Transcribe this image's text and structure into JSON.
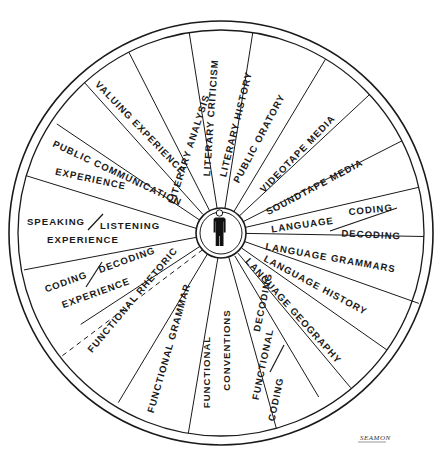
{
  "diagram": {
    "type": "wheel",
    "center_figure": "standing-person-silhouette",
    "colors": {
      "ink": "#1a1a1a",
      "background": "#ffffff"
    },
    "signature": "SEAMON",
    "segments": [
      {
        "id": "literary-criticism",
        "lines": [
          "LITERARY  CRITICISM"
        ]
      },
      {
        "id": "literary-history",
        "lines": [
          "LITERARY  HISTORY"
        ]
      },
      {
        "id": "public-oratory",
        "lines": [
          "PUBLIC  ORATORY"
        ]
      },
      {
        "id": "videotape-media",
        "lines": [
          "VIDEOTAPE  MEDIA"
        ]
      },
      {
        "id": "soundtape-media",
        "lines": [
          "SOUNDTAPE  MEDIA"
        ]
      },
      {
        "id": "language-coding-decoding",
        "lines": [
          "LANGUAGE",
          "CODING",
          "DECODING"
        ]
      },
      {
        "id": "language-grammars",
        "lines": [
          "LANGUAGE  GRAMMARS"
        ]
      },
      {
        "id": "language-history",
        "lines": [
          "LANGUAGE  HISTORY"
        ]
      },
      {
        "id": "language-geography",
        "lines": [
          "LANGUAGE  GEOGRAPHY"
        ]
      },
      {
        "id": "functional-coding-decoding",
        "lines": [
          "FUNCTIONAL",
          "CODING",
          "DECODING"
        ]
      },
      {
        "id": "functional-conventions",
        "lines": [
          "FUNCTIONAL",
          "CONVENTIONS"
        ]
      },
      {
        "id": "functional-grammar",
        "lines": [
          "FUNCTIONAL  GRAMMAR"
        ]
      },
      {
        "id": "functional-rhetoric",
        "lines": [
          "FUNCTIONAL  RHETORIC"
        ]
      },
      {
        "id": "coding-decoding-experience",
        "lines": [
          "CODING",
          "DECODING",
          "EXPERIENCE"
        ]
      },
      {
        "id": "speaking-listening-experience",
        "lines": [
          "SPEAKING",
          "LISTENING",
          "EXPERIENCE"
        ]
      },
      {
        "id": "public-communication-experience",
        "lines": [
          "PUBLIC  COMMUNICATION",
          "EXPERIENCE"
        ]
      },
      {
        "id": "valuing-experience",
        "lines": [
          "VALUING  EXPERIENCE"
        ]
      },
      {
        "id": "literary-analysis",
        "lines": [
          "LITERARY  ANALYSIS"
        ]
      }
    ]
  }
}
